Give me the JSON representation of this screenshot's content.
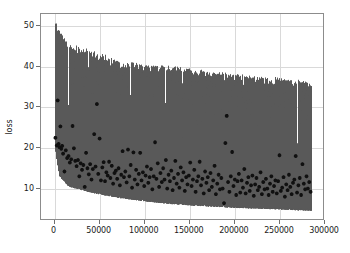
{
  "chart_data": {
    "type": "line",
    "title": "",
    "xlabel": "",
    "ylabel": "loss",
    "xlim": [
      -15000,
      300000
    ],
    "ylim": [
      2.0,
      53.0
    ],
    "xticks": [
      0,
      50000,
      100000,
      150000,
      200000,
      250000,
      300000
    ],
    "xticklabels": [
      "0",
      "50000",
      "100000",
      "150000",
      "200000",
      "250000",
      "300000"
    ],
    "yticks": [
      10,
      20,
      30,
      40,
      50
    ],
    "yticklabels": [
      "10",
      "20",
      "30",
      "40",
      "50"
    ],
    "grid": true,
    "legend": "none",
    "series": [
      {
        "name": "training loss (per-step, noisy band)",
        "type": "line",
        "color": "#595959",
        "x_start": 0,
        "x_end": 285000,
        "n_points": 2850,
        "description": "Dense noisy per-step training loss forming a filled gray band. Upper envelope decays from ~51 at step 0 to ~36 at step 285000; lower envelope decays from ~20 at step 0 to ~4.5 at step 285000.",
        "envelope_upper": [
          {
            "x": 0,
            "y": 51.5
          },
          {
            "x": 5000,
            "y": 49.0
          },
          {
            "x": 15000,
            "y": 45.5
          },
          {
            "x": 30000,
            "y": 44.5
          },
          {
            "x": 50000,
            "y": 43.0
          },
          {
            "x": 75000,
            "y": 41.0
          },
          {
            "x": 100000,
            "y": 40.5
          },
          {
            "x": 125000,
            "y": 40.0
          },
          {
            "x": 150000,
            "y": 39.5
          },
          {
            "x": 175000,
            "y": 38.5
          },
          {
            "x": 200000,
            "y": 38.0
          },
          {
            "x": 225000,
            "y": 37.5
          },
          {
            "x": 250000,
            "y": 37.0
          },
          {
            "x": 270000,
            "y": 36.5
          },
          {
            "x": 285000,
            "y": 36.0
          }
        ],
        "envelope_lower": [
          {
            "x": 0,
            "y": 20.0
          },
          {
            "x": 5000,
            "y": 13.0
          },
          {
            "x": 15000,
            "y": 10.5
          },
          {
            "x": 30000,
            "y": 9.5
          },
          {
            "x": 50000,
            "y": 8.5
          },
          {
            "x": 75000,
            "y": 7.5
          },
          {
            "x": 100000,
            "y": 6.8
          },
          {
            "x": 125000,
            "y": 6.2
          },
          {
            "x": 150000,
            "y": 5.8
          },
          {
            "x": 175000,
            "y": 5.5
          },
          {
            "x": 200000,
            "y": 5.2
          },
          {
            "x": 225000,
            "y": 5.0
          },
          {
            "x": 250000,
            "y": 4.8
          },
          {
            "x": 270000,
            "y": 4.6
          },
          {
            "x": 285000,
            "y": 4.5
          }
        ],
        "gaps": [
          {
            "x_start": 14000,
            "x_end": 15500,
            "top": 30.5
          },
          {
            "x_start": 36000,
            "x_end": 37500,
            "top": 31.5
          },
          {
            "x_start": 83000,
            "x_end": 84500,
            "top": 33.0
          },
          {
            "x_start": 122000,
            "x_end": 123500,
            "top": 31.0
          },
          {
            "x_start": 141000,
            "x_end": 142500,
            "top": 22.5
          },
          {
            "x_start": 268000,
            "x_end": 269500,
            "top": 21.0
          }
        ]
      },
      {
        "name": "validation loss (scatter)",
        "type": "scatter",
        "color": "#111111",
        "marker": "plus",
        "n_points": 300,
        "description": "Dark plus/star markers scattered over the band, trending downward from ~22 near step 0 to ~10 near step 285000, with outliers up to ~31.",
        "points": [
          {
            "x": 1000,
            "y": 22.5
          },
          {
            "x": 2500,
            "y": 20.6
          },
          {
            "x": 3500,
            "y": 31.7
          },
          {
            "x": 4500,
            "y": 21.0
          },
          {
            "x": 5500,
            "y": 20.2
          },
          {
            "x": 6500,
            "y": 25.3
          },
          {
            "x": 7500,
            "y": 19.8
          },
          {
            "x": 8500,
            "y": 20.5
          },
          {
            "x": 9500,
            "y": 18.6
          },
          {
            "x": 11000,
            "y": 14.2
          },
          {
            "x": 12500,
            "y": 19.4
          },
          {
            "x": 14000,
            "y": 17.5
          },
          {
            "x": 15500,
            "y": 18.0
          },
          {
            "x": 17000,
            "y": 16.4
          },
          {
            "x": 18500,
            "y": 17.2
          },
          {
            "x": 20000,
            "y": 25.4
          },
          {
            "x": 21500,
            "y": 19.9
          },
          {
            "x": 23000,
            "y": 16.8
          },
          {
            "x": 24500,
            "y": 15.5
          },
          {
            "x": 26000,
            "y": 17.0
          },
          {
            "x": 27500,
            "y": 13.0
          },
          {
            "x": 29000,
            "y": 16.2
          },
          {
            "x": 30500,
            "y": 14.6
          },
          {
            "x": 32000,
            "y": 15.8
          },
          {
            "x": 33500,
            "y": 10.4
          },
          {
            "x": 35000,
            "y": 18.8
          },
          {
            "x": 36500,
            "y": 15.0
          },
          {
            "x": 38000,
            "y": 13.5
          },
          {
            "x": 39500,
            "y": 16.0
          },
          {
            "x": 41000,
            "y": 12.2
          },
          {
            "x": 42500,
            "y": 14.8
          },
          {
            "x": 44000,
            "y": 23.4
          },
          {
            "x": 45500,
            "y": 15.4
          },
          {
            "x": 47000,
            "y": 30.8
          },
          {
            "x": 48500,
            "y": 13.6
          },
          {
            "x": 50000,
            "y": 22.3
          },
          {
            "x": 51500,
            "y": 12.0
          },
          {
            "x": 53000,
            "y": 15.2
          },
          {
            "x": 54500,
            "y": 16.5
          },
          {
            "x": 56000,
            "y": 11.8
          },
          {
            "x": 57500,
            "y": 14.0
          },
          {
            "x": 59000,
            "y": 13.2
          },
          {
            "x": 60500,
            "y": 16.6
          },
          {
            "x": 62000,
            "y": 12.6
          },
          {
            "x": 63500,
            "y": 15.6
          },
          {
            "x": 65000,
            "y": 11.2
          },
          {
            "x": 66500,
            "y": 13.8
          },
          {
            "x": 68000,
            "y": 14.4
          },
          {
            "x": 69500,
            "y": 12.4
          },
          {
            "x": 71000,
            "y": 15.0
          },
          {
            "x": 72500,
            "y": 10.8
          },
          {
            "x": 74000,
            "y": 13.4
          },
          {
            "x": 75500,
            "y": 19.2
          },
          {
            "x": 77000,
            "y": 12.8
          },
          {
            "x": 78500,
            "y": 14.2
          },
          {
            "x": 80000,
            "y": 11.5
          },
          {
            "x": 81500,
            "y": 19.6
          },
          {
            "x": 83000,
            "y": 13.0
          },
          {
            "x": 84500,
            "y": 15.8
          },
          {
            "x": 86000,
            "y": 10.2
          },
          {
            "x": 87500,
            "y": 18.9
          },
          {
            "x": 89000,
            "y": 12.2
          },
          {
            "x": 90500,
            "y": 14.6
          },
          {
            "x": 92000,
            "y": 11.0
          },
          {
            "x": 93500,
            "y": 13.6
          },
          {
            "x": 95000,
            "y": 18.8
          },
          {
            "x": 96500,
            "y": 12.0
          },
          {
            "x": 98000,
            "y": 14.0
          },
          {
            "x": 99500,
            "y": 10.6
          },
          {
            "x": 101000,
            "y": 13.2
          },
          {
            "x": 102500,
            "y": 15.4
          },
          {
            "x": 104000,
            "y": 11.4
          },
          {
            "x": 105500,
            "y": 12.8
          },
          {
            "x": 107000,
            "y": 14.8
          },
          {
            "x": 108500,
            "y": 9.8
          },
          {
            "x": 110000,
            "y": 13.0
          },
          {
            "x": 111500,
            "y": 21.4
          },
          {
            "x": 113000,
            "y": 12.4
          },
          {
            "x": 114500,
            "y": 16.2
          },
          {
            "x": 116000,
            "y": 10.4
          },
          {
            "x": 117500,
            "y": 13.8
          },
          {
            "x": 119000,
            "y": 11.6
          },
          {
            "x": 120500,
            "y": 15.0
          },
          {
            "x": 122000,
            "y": 12.2
          },
          {
            "x": 123500,
            "y": 17.0
          },
          {
            "x": 125000,
            "y": 10.0
          },
          {
            "x": 126500,
            "y": 13.4
          },
          {
            "x": 128000,
            "y": 11.8
          },
          {
            "x": 129500,
            "y": 14.4
          },
          {
            "x": 131000,
            "y": 9.6
          },
          {
            "x": 132500,
            "y": 12.6
          },
          {
            "x": 134000,
            "y": 16.8
          },
          {
            "x": 135500,
            "y": 11.2
          },
          {
            "x": 137000,
            "y": 13.6
          },
          {
            "x": 138500,
            "y": 10.2
          },
          {
            "x": 140000,
            "y": 15.2
          },
          {
            "x": 141500,
            "y": 12.0
          },
          {
            "x": 143000,
            "y": 14.0
          },
          {
            "x": 144500,
            "y": 9.4
          },
          {
            "x": 146000,
            "y": 12.8
          },
          {
            "x": 147500,
            "y": 11.0
          },
          {
            "x": 149000,
            "y": 13.2
          },
          {
            "x": 150500,
            "y": 16.4
          },
          {
            "x": 152000,
            "y": 10.6
          },
          {
            "x": 153500,
            "y": 12.2
          },
          {
            "x": 155000,
            "y": 14.6
          },
          {
            "x": 156500,
            "y": 9.2
          },
          {
            "x": 158000,
            "y": 11.8
          },
          {
            "x": 159500,
            "y": 13.0
          },
          {
            "x": 161000,
            "y": 16.6
          },
          {
            "x": 162500,
            "y": 10.8
          },
          {
            "x": 164000,
            "y": 12.4
          },
          {
            "x": 165500,
            "y": 8.8
          },
          {
            "x": 167000,
            "y": 14.2
          },
          {
            "x": 168500,
            "y": 11.4
          },
          {
            "x": 170000,
            "y": 12.8
          },
          {
            "x": 171500,
            "y": 9.6
          },
          {
            "x": 173000,
            "y": 13.8
          },
          {
            "x": 174500,
            "y": 10.4
          },
          {
            "x": 176000,
            "y": 12.0
          },
          {
            "x": 177500,
            "y": 15.6
          },
          {
            "x": 179000,
            "y": 8.6
          },
          {
            "x": 180500,
            "y": 11.2
          },
          {
            "x": 182000,
            "y": 13.4
          },
          {
            "x": 183500,
            "y": 9.8
          },
          {
            "x": 185000,
            "y": 12.6
          },
          {
            "x": 186500,
            "y": 10.0
          },
          {
            "x": 188000,
            "y": 6.4
          },
          {
            "x": 189500,
            "y": 21.2
          },
          {
            "x": 191000,
            "y": 27.9
          },
          {
            "x": 192500,
            "y": 11.6
          },
          {
            "x": 194000,
            "y": 9.2
          },
          {
            "x": 195500,
            "y": 13.0
          },
          {
            "x": 197000,
            "y": 19.0
          },
          {
            "x": 198500,
            "y": 10.6
          },
          {
            "x": 200000,
            "y": 12.2
          },
          {
            "x": 201500,
            "y": 8.4
          },
          {
            "x": 203000,
            "y": 11.8
          },
          {
            "x": 204500,
            "y": 13.6
          },
          {
            "x": 206000,
            "y": 9.0
          },
          {
            "x": 207500,
            "y": 12.0
          },
          {
            "x": 209000,
            "y": 10.2
          },
          {
            "x": 210500,
            "y": 14.8
          },
          {
            "x": 212000,
            "y": 8.8
          },
          {
            "x": 213500,
            "y": 11.4
          },
          {
            "x": 215000,
            "y": 12.8
          },
          {
            "x": 216500,
            "y": 9.4
          },
          {
            "x": 218000,
            "y": 10.8
          },
          {
            "x": 219500,
            "y": 13.2
          },
          {
            "x": 221000,
            "y": 8.2
          },
          {
            "x": 222500,
            "y": 11.0
          },
          {
            "x": 224000,
            "y": 12.6
          },
          {
            "x": 225500,
            "y": 9.6
          },
          {
            "x": 227000,
            "y": 10.4
          },
          {
            "x": 228500,
            "y": 14.0
          },
          {
            "x": 230000,
            "y": 8.6
          },
          {
            "x": 231500,
            "y": 11.6
          },
          {
            "x": 233000,
            "y": 9.8
          },
          {
            "x": 234500,
            "y": 12.4
          },
          {
            "x": 236000,
            "y": 10.0
          },
          {
            "x": 237500,
            "y": 8.4
          },
          {
            "x": 239000,
            "y": 11.2
          },
          {
            "x": 240500,
            "y": 13.0
          },
          {
            "x": 242000,
            "y": 9.2
          },
          {
            "x": 243500,
            "y": 10.6
          },
          {
            "x": 245000,
            "y": 12.0
          },
          {
            "x": 246500,
            "y": 8.8
          },
          {
            "x": 248000,
            "y": 11.8
          },
          {
            "x": 249500,
            "y": 18.2
          },
          {
            "x": 251000,
            "y": 9.4
          },
          {
            "x": 252500,
            "y": 10.2
          },
          {
            "x": 254000,
            "y": 12.8
          },
          {
            "x": 255500,
            "y": 8.0
          },
          {
            "x": 257000,
            "y": 11.0
          },
          {
            "x": 258500,
            "y": 9.6
          },
          {
            "x": 260000,
            "y": 13.4
          },
          {
            "x": 261500,
            "y": 10.4
          },
          {
            "x": 263000,
            "y": 8.6
          },
          {
            "x": 264500,
            "y": 11.4
          },
          {
            "x": 266000,
            "y": 12.2
          },
          {
            "x": 267500,
            "y": 18.0
          },
          {
            "x": 269000,
            "y": 9.0
          },
          {
            "x": 270500,
            "y": 10.8
          },
          {
            "x": 272000,
            "y": 12.6
          },
          {
            "x": 273500,
            "y": 8.4
          },
          {
            "x": 275000,
            "y": 16.0
          },
          {
            "x": 276500,
            "y": 11.2
          },
          {
            "x": 278000,
            "y": 9.8
          },
          {
            "x": 279500,
            "y": 13.0
          },
          {
            "x": 281000,
            "y": 10.0
          },
          {
            "x": 282500,
            "y": 11.6
          },
          {
            "x": 284000,
            "y": 9.2
          }
        ]
      }
    ]
  },
  "axes": {
    "ylabel": "loss",
    "xticklabels": [
      "0",
      "50000",
      "100000",
      "150000",
      "200000",
      "250000",
      "300000"
    ],
    "yticklabels": [
      "10",
      "20",
      "30",
      "40",
      "50"
    ]
  },
  "colors": {
    "band": "#595959",
    "scatter": "#111111",
    "grid": "#d9d9d9",
    "spine": "#8c8c8c",
    "background": "#ffffff",
    "text": "#1a1a1a"
  }
}
